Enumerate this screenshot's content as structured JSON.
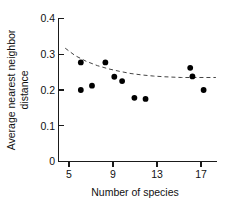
{
  "chart_data": {
    "type": "scatter",
    "title": "",
    "xlabel": "Number of species",
    "ylabel": "Average nearest neighbor distance",
    "ylabel_line1": "Average nearest neighbor",
    "ylabel_line2": "distance",
    "xlim": [
      4,
      18.2
    ],
    "ylim": [
      0,
      0.4
    ],
    "xticks": [
      5,
      9,
      13,
      17
    ],
    "xtick_labels": [
      "5",
      "9",
      "13",
      "17"
    ],
    "yticks": [
      0,
      0.1,
      0.2,
      0.3,
      0.4
    ],
    "ytick_labels": [
      "0",
      "0.1",
      "0.2",
      "0.3",
      "0.4"
    ],
    "grid": false,
    "legend": false,
    "marker": "filled-circle",
    "marker_color": "#000000",
    "points": [
      {
        "x": 6.0,
        "y": 0.277
      },
      {
        "x": 6.0,
        "y": 0.2
      },
      {
        "x": 7.0,
        "y": 0.212
      },
      {
        "x": 8.2,
        "y": 0.277
      },
      {
        "x": 9.0,
        "y": 0.237
      },
      {
        "x": 9.7,
        "y": 0.225
      },
      {
        "x": 10.8,
        "y": 0.178
      },
      {
        "x": 11.8,
        "y": 0.175
      },
      {
        "x": 15.8,
        "y": 0.262
      },
      {
        "x": 16.0,
        "y": 0.238
      },
      {
        "x": 17.0,
        "y": 0.2
      }
    ],
    "trend": {
      "style": "dashed",
      "color": "#444444",
      "description": "decaying curve flattening to asymptote",
      "points": [
        {
          "x": 4.6,
          "y": 0.317
        },
        {
          "x": 5.5,
          "y": 0.296
        },
        {
          "x": 6.5,
          "y": 0.28
        },
        {
          "x": 7.5,
          "y": 0.268
        },
        {
          "x": 8.5,
          "y": 0.259
        },
        {
          "x": 9.5,
          "y": 0.252
        },
        {
          "x": 10.5,
          "y": 0.246
        },
        {
          "x": 11.5,
          "y": 0.242
        },
        {
          "x": 12.5,
          "y": 0.239
        },
        {
          "x": 13.5,
          "y": 0.237
        },
        {
          "x": 15.0,
          "y": 0.235
        },
        {
          "x": 16.5,
          "y": 0.235
        },
        {
          "x": 18.1,
          "y": 0.235
        }
      ]
    }
  }
}
